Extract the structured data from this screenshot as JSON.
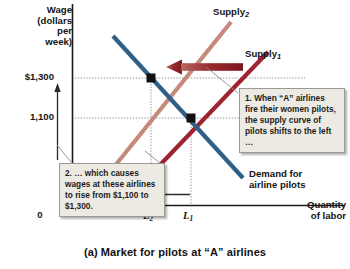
{
  "figure": {
    "caption": "(a) Market for pilots at “A” airlines"
  },
  "axes": {
    "y_title": "Wage\n(dollars\nper\nweek)",
    "x_title": "Quantity\nof labor",
    "origin_label": "0",
    "y_ticks": [
      {
        "label": "$1,300",
        "value": 1300
      },
      {
        "label": "1,100",
        "value": 1100
      }
    ],
    "x_ticks": [
      {
        "label": "L",
        "subscript": "2"
      },
      {
        "label": "L",
        "subscript": "1"
      }
    ]
  },
  "curves": [
    {
      "name": "supply2",
      "label": "Supply",
      "subscript": "2",
      "color": "#c58a7c"
    },
    {
      "name": "supply1",
      "label": "Supply",
      "subscript": "1",
      "color": "#9e2330"
    },
    {
      "name": "demand",
      "label": "Demand for\nairline pilots",
      "color": "#2e5f86"
    }
  ],
  "annotations": [
    {
      "name": "callout-supply-shift",
      "text": "1. When “A” airlines fire their women pilots, the supply curve of pilots shifts to the left …"
    },
    {
      "name": "callout-wage-rise",
      "text": "2. … which causes wages at these airlines to rise from $1,100 to $1,300."
    }
  ],
  "colors": {
    "supply_shifted": "#c58a7c",
    "supply_original": "#9e2330",
    "demand": "#2e5f86",
    "arrow_big": "#8f1f28",
    "equilibrium_point": "#111111",
    "callout_bg": "#eceae2",
    "callout_border": "#9a9a92"
  }
}
